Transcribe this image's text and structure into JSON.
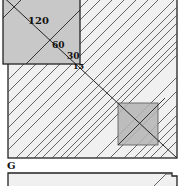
{
  "figure": {
    "panel_label": "G",
    "scale_labels": [
      "120",
      "60",
      "30",
      "15"
    ],
    "colors": {
      "background": "#ffffff",
      "hatched_fill": "#f0f0f0",
      "gray_square": "#c8c8c8",
      "small_square": "#b4b4b4",
      "line": "#222222",
      "hatch_line": "#555555"
    }
  }
}
